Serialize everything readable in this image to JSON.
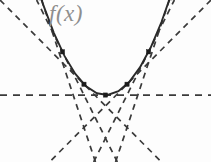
{
  "figure": {
    "background_color": "#fdfdfd",
    "width": 211,
    "height": 162,
    "label": {
      "text": "f(x)",
      "color": "#8e8e8e",
      "x": 49,
      "y": 1
    }
  },
  "chart_data": {
    "type": "line",
    "title": "",
    "xlabel": "",
    "ylabel": "",
    "legend": [
      "f(x)"
    ],
    "grid": false,
    "xlim": [
      -2.45,
      2.45
    ],
    "ylim": [
      -1.55,
      2.2
    ],
    "curve": {
      "name": "f(x)",
      "expression": "x^2",
      "style": "solid",
      "color": "#2a2a2a",
      "x": [
        -2.45,
        -2.2,
        -1.95,
        -1.7,
        -1.45,
        -1.2,
        -0.95,
        -0.7,
        -0.45,
        -0.2,
        0.05,
        0.3,
        0.55,
        0.8,
        1.05,
        1.3,
        1.55,
        1.8,
        2.05,
        2.3,
        2.45
      ],
      "y": [
        6.0,
        4.84,
        3.8,
        2.89,
        2.1,
        1.44,
        0.9,
        0.49,
        0.2,
        0.04,
        0.0025,
        0.09,
        0.3,
        0.64,
        1.1,
        1.69,
        2.4,
        3.24,
        4.2,
        5.29,
        6.0
      ]
    },
    "tangent_points": [
      {
        "index": 0,
        "x": -1.5,
        "y": 2.25,
        "slope": -3.0,
        "px": 41,
        "py": 33
      },
      {
        "index": 1,
        "x": -1.0,
        "y": 1.0,
        "slope": -2.0,
        "px": 63,
        "py": 62
      },
      {
        "index": 2,
        "x": -0.5,
        "y": 0.25,
        "slope": -1.0,
        "px": 85,
        "py": 81
      },
      {
        "index": 3,
        "x": 0.0,
        "y": 0.0,
        "slope": 0.0,
        "px": 106,
        "py": 88
      },
      {
        "index": 4,
        "x": 0.5,
        "y": 0.25,
        "slope": 1.0,
        "px": 128,
        "py": 81
      },
      {
        "index": 5,
        "x": 1.0,
        "y": 1.0,
        "slope": 2.0,
        "px": 150,
        "py": 62
      },
      {
        "index": 6,
        "x": 1.5,
        "y": 2.25,
        "slope": 3.0,
        "px": 171,
        "py": 33
      }
    ],
    "tangent_lines": [
      {
        "index": 0,
        "slope": -3.0,
        "intercept": -2.25,
        "style": "dashed",
        "color": "#3a3a3a"
      },
      {
        "index": 1,
        "slope": -2.0,
        "intercept": -1.0,
        "style": "dashed",
        "color": "#3a3a3a"
      },
      {
        "index": 2,
        "slope": -1.0,
        "intercept": -0.25,
        "style": "dashed",
        "color": "#3a3a3a"
      },
      {
        "index": 3,
        "slope": 0.0,
        "intercept": 0.0,
        "style": "dashed",
        "color": "#3a3a3a"
      },
      {
        "index": 4,
        "slope": 1.0,
        "intercept": -0.25,
        "style": "dashed",
        "color": "#3a3a3a"
      },
      {
        "index": 5,
        "slope": 2.0,
        "intercept": -1.0,
        "style": "dashed",
        "color": "#3a3a3a"
      },
      {
        "index": 6,
        "slope": 3.0,
        "intercept": -2.25,
        "style": "dashed",
        "color": "#3a3a3a"
      }
    ]
  }
}
